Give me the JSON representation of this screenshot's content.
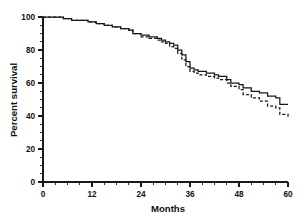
{
  "chart_data": {
    "type": "line",
    "title": "",
    "subtitle": "",
    "xlabel": "Months",
    "ylabel": "Percent survival",
    "xlim": [
      0,
      60
    ],
    "ylim": [
      0,
      100
    ],
    "xticks": [
      0,
      12,
      24,
      36,
      48,
      60
    ],
    "yticks": [
      0,
      20,
      40,
      60,
      80,
      100
    ],
    "xtick_labels": [
      "0",
      "12",
      "24",
      "36",
      "48",
      "60"
    ],
    "ytick_labels": [
      "0",
      "20",
      "40",
      "60",
      "80",
      "100"
    ],
    "x_minor_tick_interval": 3,
    "y_minor_tick_interval": 5,
    "grid": false,
    "legend": false,
    "legend_position": "none",
    "style": "kaplan-meier step survival curves",
    "series": [
      {
        "name": "Group 1",
        "line_style": "solid",
        "color": "#171717",
        "step": "post",
        "x": [
          0,
          3,
          5,
          7,
          9,
          11,
          13,
          15,
          17,
          19,
          21,
          22,
          24,
          26,
          28,
          29,
          30,
          31,
          32,
          33,
          34,
          35,
          36,
          37,
          38,
          40,
          42,
          43,
          45,
          46,
          48,
          49,
          51,
          53,
          55,
          57,
          58,
          60
        ],
        "y": [
          100,
          100,
          99,
          98,
          98,
          97,
          96,
          95,
          94,
          93,
          92,
          90,
          89,
          88,
          87,
          86,
          85,
          84,
          83,
          80,
          77,
          73,
          69,
          68,
          67,
          66,
          65,
          64,
          62,
          60,
          59,
          57,
          55,
          54,
          52,
          51,
          47,
          47
        ]
      },
      {
        "name": "Group 2",
        "line_style": "dashed",
        "color": "#171717",
        "step": "post",
        "x": [
          0,
          3,
          5,
          7,
          9,
          11,
          13,
          15,
          17,
          19,
          21,
          22,
          24,
          26,
          28,
          29,
          30,
          31,
          32,
          33,
          34,
          35,
          36,
          37,
          38,
          40,
          42,
          43,
          45,
          46,
          48,
          49,
          51,
          53,
          55,
          57,
          58,
          60
        ],
        "y": [
          100,
          100,
          99,
          98,
          98,
          97,
          96,
          95,
          94,
          93,
          92,
          90,
          88,
          87,
          86,
          85,
          84,
          82,
          81,
          78,
          74,
          70,
          67,
          66,
          65,
          64,
          63,
          62,
          60,
          58,
          56,
          53,
          51,
          49,
          46,
          45,
          41,
          39
        ]
      }
    ],
    "endpoints": {
      "solid_final_percent": 47,
      "dashed_final_percent": 39,
      "divergence_month": 30
    }
  }
}
